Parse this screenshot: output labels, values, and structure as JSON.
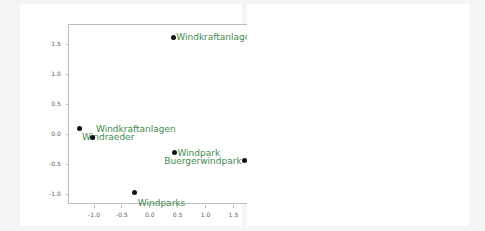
{
  "figure": {
    "background_color": "#f4f6f5",
    "panel_color": "#ffffff",
    "label_color": "#3f8a4f",
    "point_color": "#111111",
    "axis_color": "#b9bcbd"
  },
  "chart_data": [
    {
      "type": "scatter",
      "title": "",
      "xlabel": "",
      "ylabel": "",
      "xlim": [
        -1.45,
        1.85
      ],
      "ylim": [
        -1.18,
        1.82
      ],
      "xticks": [
        "-1.0",
        "-0.5",
        "0.0",
        "0.5",
        "1.0",
        "1.5"
      ],
      "xtick_values": [
        -1.0,
        -0.5,
        0.0,
        0.5,
        1.0,
        1.5
      ],
      "yticks": [
        "1.5",
        "1.0",
        "0.5",
        "0.0",
        "-0.5",
        "-1.0"
      ],
      "ytick_values": [
        1.5,
        1.0,
        0.5,
        0.0,
        -0.5,
        -1.0
      ],
      "grid": false,
      "legend": "none",
      "points": [
        {
          "label": "Windkraftanlage",
          "x": 0.42,
          "y": 1.62,
          "anchor": "right",
          "dy": 0.0
        },
        {
          "label": "Windraeder",
          "x": -1.27,
          "y": 0.1,
          "anchor": "right",
          "dy": 0.14
        },
        {
          "label": "Windkraftanlagen",
          "x": -1.02,
          "y": -0.05,
          "anchor": "right",
          "dy": -0.13
        },
        {
          "label": "Windpark",
          "x": 0.44,
          "y": -0.31,
          "anchor": "right",
          "dy": 0.0
        },
        {
          "label": "Buergerwindpark",
          "x": 1.7,
          "y": -0.44,
          "anchor": "left",
          "dy": 0.0
        },
        {
          "label": "Windparks",
          "x": -0.27,
          "y": -0.97,
          "anchor": "right",
          "dy": 0.17
        }
      ]
    },
    {
      "type": "scatter",
      "title": "",
      "xlabel": "",
      "ylabel": "",
      "xlim": [
        -1.22,
        1.95
      ],
      "ylim": [
        -1.02,
        1.27
      ],
      "xticks": [
        "-1.0",
        "-0.5",
        "0.0",
        "0.5",
        "1.0",
        "1.5"
      ],
      "xtick_values": [
        -1.0,
        -0.5,
        0.0,
        0.5,
        1.0,
        1.5
      ],
      "yticks": [
        "1.00",
        "0.75",
        "0.50",
        "0.25",
        "0.00",
        "-0.25",
        "-0.50",
        "-0.75"
      ],
      "ytick_values": [
        1.0,
        0.75,
        0.5,
        0.25,
        0.0,
        -0.25,
        -0.5,
        -0.75
      ],
      "grid": false,
      "legend": "none",
      "points": [
        {
          "label": "Fachplaner",
          "x": -1.02,
          "y": 1.13,
          "anchor": "right",
          "dy": -0.04
        },
        {
          "label": "Energieberater",
          "x": 0.58,
          "y": 1.13,
          "anchor": "right",
          "dy": -0.03,
          "dark": true
        },
        {
          "label": "Energieberatung",
          "x": 1.83,
          "y": -0.25,
          "anchor": "left",
          "dy": 0.02
        },
        {
          "label": "Klimaschutzmanager",
          "x": -0.82,
          "y": -0.35,
          "anchor": "right",
          "dy": -0.07
        },
        {
          "label": "Wohnberater",
          "x": -1.18,
          "y": -0.78,
          "anchor": "right",
          "dy": 0.0
        },
        {
          "label": "Energieberaterin",
          "x": -0.2,
          "y": -0.93,
          "anchor": "right",
          "dy": 0.0
        }
      ]
    }
  ]
}
